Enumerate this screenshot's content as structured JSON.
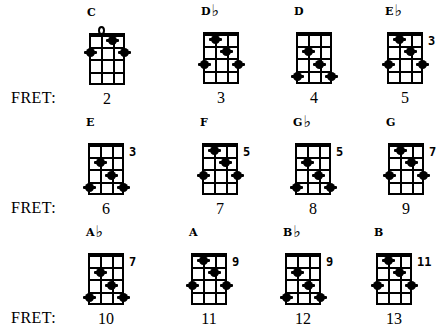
{
  "fret_label": "FRET:",
  "rows": [
    {
      "fret_label_y": 89
    },
    {
      "fret_label_y": 199
    },
    {
      "fret_label_y": 309
    }
  ],
  "chords": [
    {
      "name": "C",
      "flat": false,
      "x": 89,
      "y": 33,
      "rows": 4,
      "position": "",
      "fret": "2",
      "open": [
        1
      ],
      "dots": [
        [
          2,
          1
        ],
        [
          0,
          2
        ],
        [
          3,
          2
        ]
      ]
    },
    {
      "name": "D",
      "flat": true,
      "x": 203,
      "y": 32,
      "rows": 4,
      "position": "",
      "fret": "3",
      "open": [],
      "dots": [
        [
          1,
          1
        ],
        [
          2,
          2
        ],
        [
          0,
          3
        ],
        [
          3,
          3
        ]
      ]
    },
    {
      "name": "D",
      "flat": false,
      "x": 296,
      "y": 32,
      "rows": 4,
      "position": "",
      "fret": "4",
      "open": [],
      "dots": [
        [
          1,
          2
        ],
        [
          2,
          3
        ],
        [
          0,
          4
        ],
        [
          3,
          4
        ]
      ]
    },
    {
      "name": "E",
      "flat": true,
      "x": 387,
      "y": 32,
      "rows": 4,
      "position": "3",
      "fret": "5",
      "open": [],
      "dots": [
        [
          1,
          1
        ],
        [
          2,
          2
        ],
        [
          0,
          3
        ],
        [
          3,
          3
        ]
      ]
    },
    {
      "name": "E",
      "flat": false,
      "x": 88,
      "y": 143,
      "rows": 4,
      "position": "3",
      "fret": "6",
      "open": [],
      "dots": [
        [
          1,
          2
        ],
        [
          2,
          3
        ],
        [
          0,
          4
        ],
        [
          3,
          4
        ]
      ]
    },
    {
      "name": "F",
      "flat": false,
      "x": 202,
      "y": 143,
      "rows": 4,
      "position": "5",
      "fret": "7",
      "open": [],
      "dots": [
        [
          1,
          1
        ],
        [
          2,
          2
        ],
        [
          0,
          3
        ],
        [
          3,
          3
        ]
      ]
    },
    {
      "name": "G",
      "flat": true,
      "x": 295,
      "y": 143,
      "rows": 4,
      "position": "5",
      "fret": "8",
      "open": [],
      "dots": [
        [
          1,
          2
        ],
        [
          2,
          3
        ],
        [
          0,
          4
        ],
        [
          3,
          4
        ]
      ]
    },
    {
      "name": "G",
      "flat": false,
      "x": 388,
      "y": 143,
      "rows": 4,
      "position": "7",
      "fret": "9",
      "open": [],
      "dots": [
        [
          1,
          1
        ],
        [
          2,
          2
        ],
        [
          0,
          3
        ],
        [
          3,
          3
        ]
      ]
    },
    {
      "name": "A",
      "flat": true,
      "x": 88,
      "y": 253,
      "rows": 4,
      "position": "7",
      "fret": "10",
      "open": [],
      "dots": [
        [
          1,
          2
        ],
        [
          2,
          3
        ],
        [
          0,
          4
        ],
        [
          3,
          4
        ]
      ]
    },
    {
      "name": "A",
      "flat": false,
      "x": 191,
      "y": 253,
      "rows": 4,
      "position": "9",
      "fret": "11",
      "open": [],
      "dots": [
        [
          1,
          1
        ],
        [
          2,
          2
        ],
        [
          0,
          3
        ],
        [
          3,
          3
        ]
      ]
    },
    {
      "name": "B",
      "flat": true,
      "x": 285,
      "y": 253,
      "rows": 4,
      "position": "9",
      "fret": "12",
      "open": [],
      "dots": [
        [
          1,
          2
        ],
        [
          2,
          3
        ],
        [
          0,
          4
        ],
        [
          3,
          4
        ]
      ]
    },
    {
      "name": "B",
      "flat": false,
      "x": 376,
      "y": 253,
      "rows": 4,
      "position": "11",
      "fret": "13",
      "open": [],
      "dots": [
        [
          1,
          1
        ],
        [
          2,
          2
        ],
        [
          0,
          3
        ],
        [
          3,
          3
        ]
      ]
    }
  ],
  "flat_symbol": "♭"
}
